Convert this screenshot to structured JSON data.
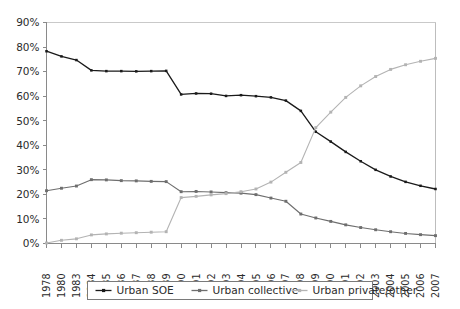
{
  "chart_data": {
    "type": "line",
    "title": "",
    "xlabel": "",
    "ylabel": "",
    "ylim": [
      0,
      90
    ],
    "ytick_labels": [
      "0%",
      "10%",
      "20%",
      "30%",
      "40%",
      "50%",
      "60%",
      "70%",
      "80%",
      "90%"
    ],
    "ytick_values": [
      0,
      10,
      20,
      30,
      40,
      50,
      60,
      70,
      80,
      90
    ],
    "grid": "horizontal-top-only",
    "legend_position": "bottom-center",
    "categories": [
      "1978",
      "1980",
      "1983",
      "1984",
      "1985",
      "1986",
      "1987",
      "1988",
      "1989",
      "1990",
      "1991",
      "1992",
      "1993",
      "1994",
      "1995",
      "1996",
      "1997",
      "1998",
      "1999",
      "2000",
      "2001",
      "2002",
      "2003",
      "2004",
      "2005",
      "2006",
      "2007"
    ],
    "series": [
      {
        "name": "Urban SOE",
        "color": "#1a1a1a",
        "marker": "square",
        "values": [
          78.3,
          76.2,
          74.7,
          70.5,
          70.2,
          70.2,
          70.1,
          70.2,
          70.3,
          60.7,
          61.1,
          61.0,
          60.1,
          60.4,
          60.0,
          59.5,
          58.2,
          54.0,
          45.5,
          41.5,
          37.3,
          33.5,
          30.0,
          27.3,
          25.1,
          23.5,
          22.2
        ]
      },
      {
        "name": "Urban collective",
        "color": "#6e6e6e",
        "marker": "square",
        "values": [
          21.5,
          22.5,
          23.4,
          26.0,
          25.9,
          25.6,
          25.5,
          25.3,
          25.2,
          21.1,
          21.2,
          21.0,
          20.7,
          20.5,
          19.9,
          18.5,
          17.2,
          12.0,
          10.4,
          9.0,
          7.6,
          6.5,
          5.6,
          4.8,
          4.1,
          3.6,
          3.2
        ]
      },
      {
        "name": "Urban private/other",
        "color": "#b3b3b3",
        "marker": "square",
        "values": [
          0.2,
          1.3,
          1.9,
          3.5,
          3.9,
          4.2,
          4.4,
          4.6,
          4.8,
          18.7,
          19.2,
          19.8,
          20.3,
          21.1,
          22.2,
          25.0,
          29.0,
          33.0,
          47.2,
          53.5,
          59.5,
          64.2,
          68.0,
          70.9,
          72.8,
          74.2,
          75.4
        ]
      }
    ]
  }
}
